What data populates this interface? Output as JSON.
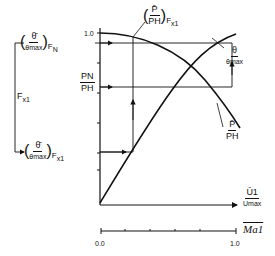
{
  "diagram": {
    "labels": {
      "theta_fn": {
        "num": "θ̄",
        "den": "θmax",
        "sub": "F",
        "subsub": "N"
      },
      "p_fx1": {
        "num": "P̄",
        "den": "PH",
        "sub": "F",
        "subsub": "x1"
      },
      "theta_curve": {
        "num": "θ",
        "den": "θmax"
      },
      "pn_ph": {
        "num": "PN",
        "den": "PH"
      },
      "p_curve": {
        "num": "P̄",
        "den": "PH"
      },
      "fx1": {
        "main": "F",
        "sub": "x1"
      },
      "theta_fx1": {
        "num": "θ̄",
        "den": "θmax",
        "sub": "F",
        "subsub": "x1"
      },
      "u1_axis": {
        "num": "Ū1",
        "den": "Umax"
      },
      "ma_axis": "Ma1"
    },
    "y_tick_top": "1.0",
    "x_axis_ticks": {
      "start": "0.0",
      "end": "1.0"
    }
  }
}
